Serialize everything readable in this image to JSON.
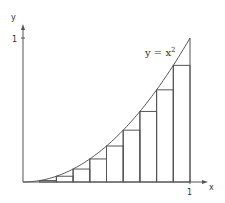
{
  "diagram": {
    "title": "",
    "axes": {
      "x_label": "x",
      "y_label": "y",
      "x_tick_label": "1",
      "y_tick_label": "1"
    },
    "curve_label": "y = x",
    "curve_label_exponent": "2",
    "colors": {
      "stroke": "#555555",
      "text": "#333333",
      "background": "#ffffff"
    }
  },
  "chart_data": {
    "type": "line",
    "title": "",
    "xlabel": "x",
    "ylabel": "y",
    "xlim": [
      0,
      1
    ],
    "ylim": [
      0,
      1
    ],
    "function": "y = x^2",
    "rectangles": {
      "method": "lower Riemann sum (left endpoints)",
      "n": 10,
      "x_left": [
        0,
        0.1,
        0.2,
        0.3,
        0.4,
        0.5,
        0.6,
        0.7,
        0.8,
        0.9
      ],
      "heights": [
        0,
        0.01,
        0.04,
        0.09,
        0.16,
        0.25,
        0.36,
        0.49,
        0.64,
        0.81
      ]
    },
    "grid": false,
    "legend": null
  }
}
